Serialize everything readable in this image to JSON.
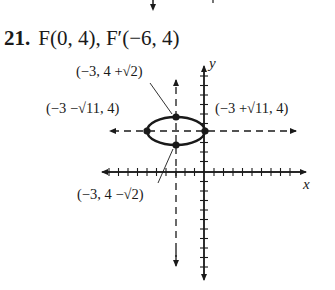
{
  "problem": {
    "number": "21.",
    "focus1": "F(0, 4),",
    "focus2": "F′(−6, 4)"
  },
  "axes": {
    "x_label": "x",
    "y_label": "y"
  },
  "labels": {
    "top_vertex": "(−3, 4 +√2)",
    "left_vertex": "(−3 −√11, 4)",
    "right_vertex": "(−3 +√11, 4)",
    "bottom_vertex": "(−3, 4 −√2)"
  },
  "ellipse": {
    "center": [
      -3,
      4
    ],
    "semi_major_axis": "√11",
    "semi_minor_axis": "√2",
    "orientation": "horizontal",
    "stroke_color": "#1a1a1a"
  }
}
